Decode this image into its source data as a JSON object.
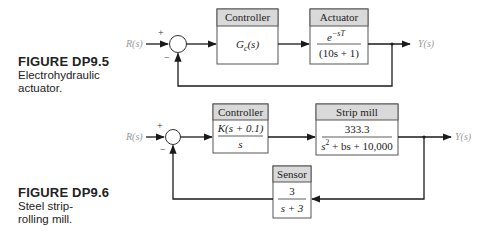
{
  "figures": [
    {
      "number": "FIGURE DP9.5",
      "caption_lines": [
        "Electrohydraulic",
        "actuator."
      ],
      "input_label": "R(s)",
      "output_label": "Y(s)",
      "sum_signs": {
        "top": "+",
        "bottom": "−"
      },
      "blocks": [
        {
          "title": "Controller",
          "tf": "Gc(s)",
          "tf_main": "G",
          "tf_sub": "c",
          "tf_rest": "(s)"
        },
        {
          "title": "Actuator",
          "numerator": "e",
          "numerator_sup": "−sT",
          "denominator": "(10s + 1)"
        }
      ]
    },
    {
      "number": "FIGURE DP9.6",
      "caption_lines": [
        "Steel strip-",
        "rolling mill."
      ],
      "input_label": "R(s)",
      "output_label": "Y(s)",
      "sum_signs": {
        "top": "+",
        "bottom": "−"
      },
      "blocks": [
        {
          "title": "Controller",
          "numerator": "K(s + 0.1)",
          "denominator": "s"
        },
        {
          "title": "Strip mill",
          "numerator": "333.3",
          "denominator_pre": "s",
          "denominator_sup": "2",
          "denominator_post": " + bs + 10,000"
        },
        {
          "title": "Sensor",
          "numerator": "3",
          "denominator": "s + 3"
        }
      ]
    }
  ],
  "colors": {
    "line": "#1a1a1a",
    "block_header": "#d9d9d9",
    "block_border": "#555555",
    "signal_label": "#9a9a9a"
  }
}
